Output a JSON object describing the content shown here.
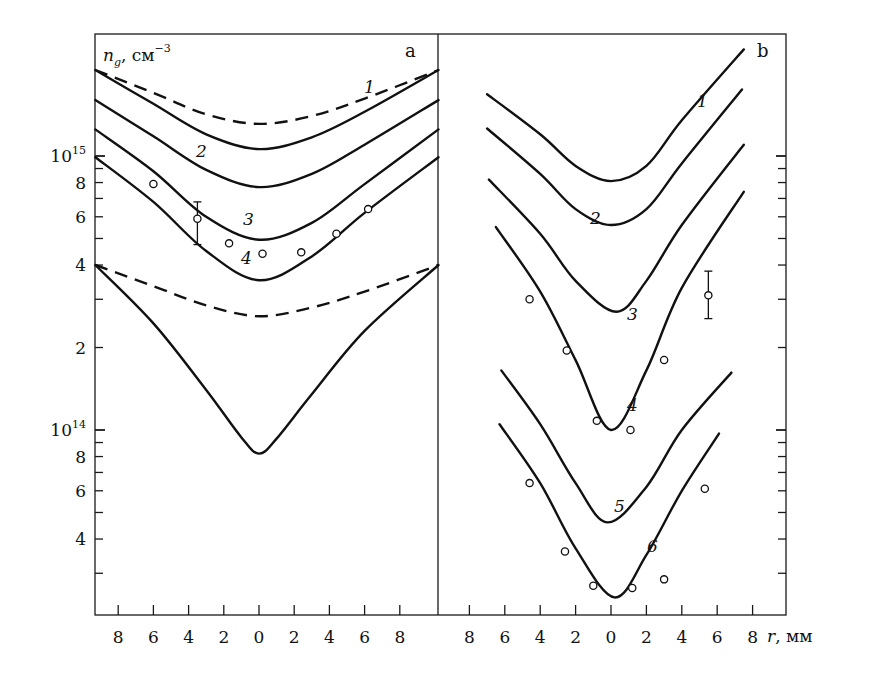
{
  "chart_data": [
    {
      "panel": "a",
      "type": "line",
      "title": "",
      "panel_label": "a",
      "xlabel": "",
      "ylabel": "n_g, см^-3",
      "yscale": "log",
      "ylim": [
        23000000000000.0,
        3300000000000000.0
      ],
      "xlim": [
        -9.3,
        10.2
      ],
      "x_tick_labels": [
        "8",
        "6",
        "4",
        "2",
        "0",
        "2",
        "4",
        "6",
        "8"
      ],
      "x_tick_values": [
        -8,
        -6,
        -4,
        -2,
        0,
        2,
        4,
        6,
        8
      ],
      "y_tick_labels": [
        {
          "value": 1000000000000000.0,
          "mantissa": "10",
          "exp": "15"
        },
        {
          "value": 800000000000000.0,
          "label": "8"
        },
        {
          "value": 600000000000000.0,
          "label": "6"
        },
        {
          "value": 400000000000000.0,
          "label": "4"
        },
        {
          "value": 200000000000000.0,
          "label": "2"
        },
        {
          "value": 100000000000000.0,
          "mantissa": "10",
          "exp": "14"
        },
        {
          "value": 80000000000000.0,
          "label": "8"
        },
        {
          "value": 60000000000000.0,
          "label": "6"
        },
        {
          "value": 40000000000000.0,
          "label": "4"
        }
      ],
      "series": [
        {
          "name": "1 (dashed)",
          "label": "1",
          "style": "dashed",
          "r": [
            -9.3,
            -6,
            -3,
            0,
            3,
            6,
            10.2
          ],
          "n": [
            2060000000000000.0,
            1700000000000000.0,
            1420000000000000.0,
            1310000000000000.0,
            1400000000000000.0,
            1620000000000000.0,
            2060000000000000.0
          ]
        },
        {
          "name": "1 (solid)",
          "label": "",
          "style": "solid",
          "r": [
            -9.3,
            -6,
            -3,
            0,
            3,
            6,
            10.2
          ],
          "n": [
            2060000000000000.0,
            1550000000000000.0,
            1200000000000000.0,
            1060000000000000.0,
            1170000000000000.0,
            1450000000000000.0,
            2060000000000000.0
          ]
        },
        {
          "name": "2",
          "label": "2",
          "style": "solid",
          "r": [
            -9.3,
            -6,
            -3,
            0,
            3,
            6,
            10.2
          ],
          "n": [
            1600000000000000.0,
            1180000000000000.0,
            890000000000000.0,
            770000000000000.0,
            860000000000000.0,
            1100000000000000.0,
            1600000000000000.0
          ]
        },
        {
          "name": "3",
          "label": "3",
          "style": "solid",
          "r": [
            -9.3,
            -6,
            -3,
            0,
            3,
            6,
            10.2
          ],
          "n": [
            1250000000000000.0,
            880000000000000.0,
            600000000000000.0,
            495000000000000.0,
            570000000000000.0,
            790000000000000.0,
            1250000000000000.0
          ],
          "points": {
            "r": [
              -6.0,
              -3.5,
              -1.7,
              0.2,
              2.4,
              4.4,
              6.2
            ],
            "n": [
              790000000000000.0,
              590000000000000.0,
              480000000000000.0,
              440000000000000.0,
              445000000000000.0,
              520000000000000.0,
              640000000000000.0
            ]
          },
          "error_bar": {
            "r": -3.5,
            "n_low": 475000000000000.0,
            "n_high": 680000000000000.0
          }
        },
        {
          "name": "4",
          "label": "4",
          "style": "solid",
          "r": [
            -9.3,
            -6,
            -3,
            0,
            3,
            6,
            10.2
          ],
          "n": [
            990000000000000.0,
            680000000000000.0,
            450000000000000.0,
            352000000000000.0,
            430000000000000.0,
            620000000000000.0,
            990000000000000.0
          ]
        },
        {
          "name": "lower dashed",
          "label": "",
          "style": "dashed",
          "r": [
            -9.3,
            -6,
            -3,
            0,
            3,
            6,
            10.2
          ],
          "n": [
            400000000000000.0,
            335000000000000.0,
            285000000000000.0,
            260000000000000.0,
            280000000000000.0,
            320000000000000.0,
            400000000000000.0
          ]
        },
        {
          "name": "lower solid (V)",
          "label": "",
          "style": "solid",
          "r": [
            -9.3,
            -6,
            -3,
            -1,
            0,
            1,
            3,
            6,
            10.2
          ],
          "n": [
            400000000000000.0,
            245000000000000.0,
            140000000000000.0,
            94000000000000.0,
            82000000000000.0,
            93000000000000.0,
            135000000000000.0,
            230000000000000.0,
            400000000000000.0
          ]
        }
      ]
    },
    {
      "panel": "b",
      "type": "line",
      "title": "",
      "panel_label": "b",
      "xlabel": "r, мм",
      "ylabel": "n_g, см^-3 (shared with panel a)",
      "yscale": "log",
      "xlim": [
        -9.8,
        9.8
      ],
      "x_tick_labels": [
        "8",
        "6",
        "4",
        "2",
        "0",
        "2",
        "4",
        "6",
        "8"
      ],
      "x_tick_values": [
        -8,
        -6,
        -4,
        -2,
        0,
        2,
        4,
        6,
        8
      ],
      "series": [
        {
          "name": "1",
          "label": "1",
          "style": "solid",
          "r": [
            -7.0,
            -4,
            -2,
            0,
            2,
            4,
            7.5
          ],
          "n": [
            1680000000000000.0,
            1200000000000000.0,
            920000000000000.0,
            810000000000000.0,
            920000000000000.0,
            1350000000000000.0,
            2450000000000000.0
          ]
        },
        {
          "name": "2",
          "label": "2",
          "style": "solid",
          "r": [
            -7.0,
            -4,
            -2,
            0,
            2,
            4,
            7.4
          ],
          "n": [
            1260000000000000.0,
            860000000000000.0,
            640000000000000.0,
            560000000000000.0,
            640000000000000.0,
            940000000000000.0,
            1750000000000000.0
          ]
        },
        {
          "name": "3",
          "label": "3",
          "style": "solid",
          "r": [
            -6.9,
            -4,
            -2,
            0.3,
            2,
            4,
            7.5
          ],
          "n": [
            820000000000000.0,
            520000000000000.0,
            350000000000000.0,
            270000000000000.0,
            350000000000000.0,
            560000000000000.0,
            1100000000000000.0
          ]
        },
        {
          "name": "4",
          "label": "4",
          "style": "solid",
          "r": [
            -6.5,
            -4,
            -2,
            0,
            2,
            4,
            7.5
          ],
          "n": [
            550000000000000.0,
            320000000000000.0,
            180000000000000.0,
            100000000000000.0,
            165000000000000.0,
            330000000000000.0,
            740000000000000.0
          ],
          "points": {
            "r": [
              -4.6,
              -2.5,
              -0.8,
              1.1,
              3.0,
              5.5
            ],
            "n": [
              300000000000000.0,
              195000000000000.0,
              108000000000000.0,
              100000000000000.0,
              180000000000000.0,
              310000000000000.0
            ]
          },
          "error_bar": {
            "r": 5.5,
            "n_low": 255000000000000.0,
            "n_high": 380000000000000.0
          }
        },
        {
          "name": "5",
          "label": "5",
          "style": "solid",
          "r": [
            -6.2,
            -4,
            -2,
            -0.2,
            2,
            4,
            6.8
          ],
          "n": [
            165000000000000.0,
            105000000000000.0,
            64000000000000.0,
            46000000000000.0,
            62000000000000.0,
            100000000000000.0,
            162000000000000.0
          ]
        },
        {
          "name": "6",
          "label": "6",
          "style": "solid",
          "r": [
            -6.3,
            -4,
            -2,
            0.2,
            2,
            4,
            6.1
          ],
          "n": [
            105000000000000.0,
            64000000000000.0,
            37000000000000.0,
            24500000000000.0,
            35000000000000.0,
            60000000000000.0,
            97000000000000.0
          ],
          "points": {
            "r": [
              -4.6,
              -2.6,
              -1.0,
              1.2,
              3.0,
              5.3
            ],
            "n": [
              64000000000000.0,
              36000000000000.0,
              27000000000000.0,
              26500000000000.0,
              28500000000000.0,
              61000000000000.0
            ]
          }
        }
      ]
    }
  ],
  "labels": {
    "panel_a": "a",
    "panel_b": "b",
    "y_axis_symbol": "n",
    "y_axis_subscript": "g",
    "y_axis_units": ", см",
    "y_axis_units_exp": "−3",
    "x_axis_symbol": "r",
    "x_axis_units": ", мм"
  }
}
